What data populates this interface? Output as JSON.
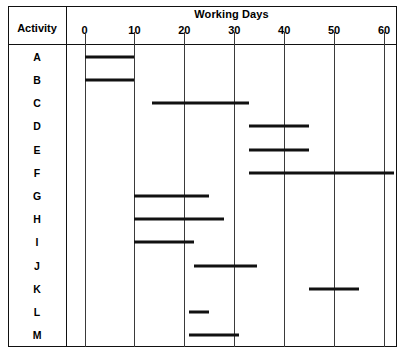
{
  "chart_data": {
    "type": "bar",
    "orientation": "horizontal",
    "subtype": "gantt",
    "title": "Working Days",
    "xlabel": "Working Days",
    "ylabel": "Activity",
    "xlim": [
      0,
      63
    ],
    "ylim": [
      0,
      13
    ],
    "grid": true,
    "legend": false,
    "xticks": [
      0,
      10,
      20,
      30,
      40,
      50,
      60
    ],
    "xtick_labels": [
      "0",
      "10",
      "20",
      "30",
      "40",
      "50",
      "60"
    ],
    "categories": [
      "A",
      "B",
      "C",
      "D",
      "E",
      "F",
      "G",
      "H",
      "I",
      "J",
      "K",
      "L",
      "M"
    ],
    "bars": [
      {
        "activity": "A",
        "start": 0,
        "end": 10
      },
      {
        "activity": "B",
        "start": 0,
        "end": 10
      },
      {
        "activity": "C",
        "start": 13.5,
        "end": 33
      },
      {
        "activity": "D",
        "start": 33,
        "end": 45
      },
      {
        "activity": "E",
        "start": 33,
        "end": 45
      },
      {
        "activity": "F",
        "start": 33,
        "end": 62
      },
      {
        "activity": "G",
        "start": 10,
        "end": 25
      },
      {
        "activity": "H",
        "start": 10,
        "end": 28
      },
      {
        "activity": "I",
        "start": 10,
        "end": 22
      },
      {
        "activity": "J",
        "start": 22,
        "end": 34.5
      },
      {
        "activity": "K",
        "start": 45,
        "end": 55
      },
      {
        "activity": "L",
        "start": 21,
        "end": 25
      },
      {
        "activity": "M",
        "start": 21,
        "end": 31
      }
    ],
    "durations": [
      10,
      10,
      19.5,
      12,
      12,
      29,
      15,
      18,
      12,
      12.5,
      10,
      4,
      10
    ]
  },
  "header": {
    "activity_column_label": "Activity",
    "axis_title": "Working Days"
  },
  "colors": {
    "bar": "#111111",
    "frame": "#111111",
    "grid": "#3a3a3a",
    "background": "#ffffff"
  }
}
